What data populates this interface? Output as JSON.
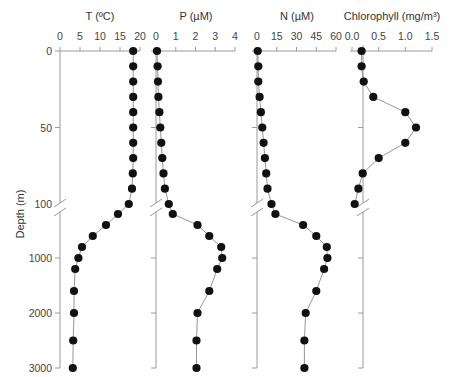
{
  "chart_data": {
    "type": "scatter",
    "title": "",
    "ylabel": "Depth (m)",
    "y_axis": {
      "upper_segment": {
        "range": [
          0,
          100
        ],
        "ticks": [
          0,
          50,
          100
        ]
      },
      "lower_segment": {
        "range": [
          100,
          3000
        ],
        "ticks": [
          1000,
          2000,
          3000
        ]
      },
      "broken": true,
      "inverted": true
    },
    "panels": [
      {
        "name": "T",
        "xlabel": "T (ºC)",
        "xlim": [
          0,
          20
        ],
        "ticks": [
          0,
          5,
          10,
          15,
          20
        ],
        "tick_labels": [
          "0",
          "5",
          "10",
          "15",
          "20"
        ],
        "depths": [
          0,
          10,
          20,
          30,
          40,
          50,
          60,
          70,
          80,
          90,
          100,
          200,
          400,
          600,
          800,
          1000,
          1200,
          1600,
          2000,
          2500,
          3000
        ],
        "values": [
          18.3,
          18.3,
          18.3,
          18.3,
          18.3,
          18.3,
          18.3,
          18.3,
          18.2,
          18.0,
          17.2,
          14.5,
          11.5,
          8.2,
          5.5,
          4.6,
          3.8,
          3.5,
          3.5,
          3.3,
          3.2
        ]
      },
      {
        "name": "P",
        "xlabel": "P (µM)",
        "xlim": [
          0,
          4
        ],
        "ticks": [
          0,
          1,
          2,
          3,
          4
        ],
        "tick_labels": [
          "0",
          "1",
          "2",
          "3",
          "4"
        ],
        "depths": [
          0,
          10,
          20,
          30,
          40,
          50,
          60,
          70,
          80,
          90,
          100,
          200,
          400,
          600,
          800,
          1000,
          1200,
          1600,
          2000,
          2500,
          3000
        ],
        "values": [
          0.05,
          0.08,
          0.1,
          0.12,
          0.17,
          0.22,
          0.27,
          0.32,
          0.38,
          0.45,
          0.65,
          0.85,
          2.1,
          2.7,
          3.3,
          3.35,
          3.1,
          2.7,
          2.1,
          2.05,
          2.05
        ]
      },
      {
        "name": "N",
        "xlabel": "N (µM)",
        "xlim": [
          0,
          60
        ],
        "ticks": [
          0,
          15,
          30,
          45,
          60
        ],
        "tick_labels": [
          "0",
          "15",
          "30",
          "45",
          "60"
        ],
        "depths": [
          0,
          10,
          20,
          30,
          40,
          50,
          60,
          70,
          80,
          90,
          100,
          200,
          400,
          600,
          800,
          1000,
          1200,
          1600,
          2000,
          2500,
          3000
        ],
        "values": [
          0.5,
          1,
          1,
          2,
          3,
          4,
          5,
          6,
          7,
          8,
          11,
          14,
          35,
          45,
          53,
          53.5,
          51,
          45,
          37,
          36,
          36
        ]
      },
      {
        "name": "Chlorophyll",
        "xlabel": "Chlorophyll (mg/m³)",
        "xlim": [
          0,
          1.5
        ],
        "ticks": [
          0,
          0.5,
          1.0,
          1.5
        ],
        "tick_labels": [
          "0.0",
          "0.5",
          "1.0",
          "1.5"
        ],
        "depths": [
          0,
          10,
          20,
          30,
          40,
          50,
          60,
          70,
          80,
          90,
          100
        ],
        "values": [
          0.18,
          0.18,
          0.22,
          0.4,
          1.0,
          1.2,
          1.0,
          0.5,
          0.2,
          0.12,
          0.05
        ]
      }
    ],
    "depth_tick_labels": [
      "0",
      "50",
      "100",
      "1000",
      "2000",
      "3000"
    ],
    "grid": false,
    "legend": null
  }
}
